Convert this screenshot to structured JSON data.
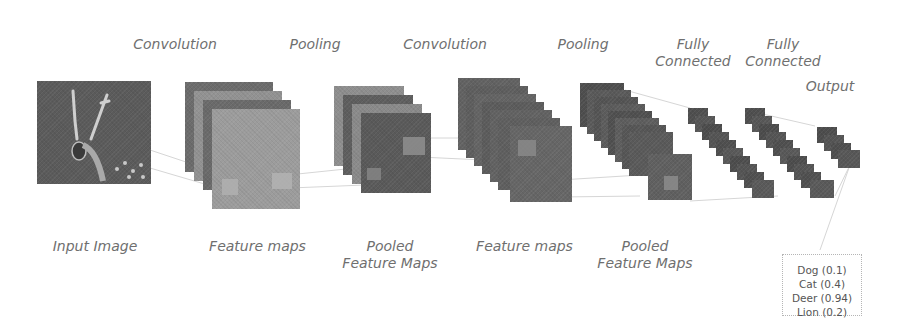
{
  "stages": {
    "convolution_1": "Convolution",
    "pooling_1": "Pooling",
    "convolution_2": "Convolution",
    "pooling_2": "Pooling",
    "fully_connected_1": [
      "Fully",
      "Connected"
    ],
    "fully_connected_2": [
      "Fully",
      "Connected"
    ],
    "output": "Output"
  },
  "bottom_labels": {
    "input_image": "Input Image",
    "feature_maps_1": "Feature maps",
    "pooled_1": [
      "Pooled",
      "Feature Maps"
    ],
    "feature_maps_2": "Feature maps",
    "pooled_2": [
      "Pooled",
      "Feature Maps"
    ]
  },
  "output_classes": [
    {
      "label": "Dog (0.1)"
    },
    {
      "label": "Cat (0.4)"
    },
    {
      "label": "Deer (0.94)"
    },
    {
      "label": "Lion (0.2)"
    }
  ],
  "colors": {
    "background": "#ffffff",
    "label_text": "#6f6f6f",
    "dark_map": "#5a5a5a",
    "mid_map": "#7a7a7a",
    "light_map": "#9a9a9a"
  }
}
